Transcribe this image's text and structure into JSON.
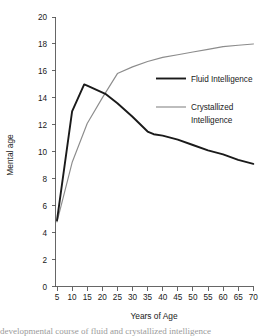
{
  "chart_data": {
    "type": "line",
    "title": "",
    "xlabel": "Years of Age",
    "ylabel": "Mental age",
    "xlim": [
      5,
      70
    ],
    "ylim": [
      0,
      20
    ],
    "grid": false,
    "legend_position": "inside-right",
    "xticks": [
      5,
      10,
      15,
      20,
      25,
      30,
      35,
      40,
      45,
      50,
      55,
      60,
      65,
      70
    ],
    "yticks": [
      0,
      2,
      4,
      6,
      8,
      10,
      12,
      14,
      16,
      18,
      20
    ],
    "series": [
      {
        "name": "Fluid Intelligence",
        "color": "#1a1a1a",
        "x": [
          5,
          10,
          14,
          15,
          21,
          25,
          30,
          35,
          37,
          40,
          45,
          50,
          55,
          60,
          65,
          70
        ],
        "values": [
          4.9,
          13.0,
          15.0,
          14.9,
          14.3,
          13.6,
          12.6,
          11.5,
          11.3,
          11.2,
          10.9,
          10.5,
          10.1,
          9.8,
          9.4,
          9.1
        ]
      },
      {
        "name": "Crystallized Intelligence",
        "color": "#8c8c8c",
        "x": [
          5,
          10,
          15,
          20,
          25,
          30,
          35,
          40,
          45,
          50,
          55,
          60,
          65,
          70
        ],
        "values": [
          4.8,
          9.2,
          12.1,
          14.0,
          15.8,
          16.3,
          16.7,
          17.0,
          17.2,
          17.4,
          17.6,
          17.8,
          17.9,
          18.0
        ]
      }
    ]
  },
  "legend": {
    "entries": [
      {
        "label": "Fluid Intelligence",
        "color": "#1a1a1a"
      },
      {
        "label": "Crystallized",
        "label2": "Intelligence",
        "color": "#8c8c8c"
      }
    ],
    "fluid_label": "Fluid Intelligence",
    "crystal_label_line1": "Crystallized",
    "crystal_label_line2": "Intelligence"
  },
  "axes": {
    "y_title": "Mental age",
    "x_title": "Years of Age",
    "y_tick_labels": [
      "20",
      "18",
      "16",
      "14",
      "12",
      "10",
      "8",
      "6",
      "4",
      "2",
      "0"
    ],
    "x_tick_labels": [
      "5",
      "10",
      "15",
      "20",
      "25",
      "30",
      "35",
      "40",
      "45",
      "50",
      "55",
      "60",
      "65",
      "70"
    ]
  },
  "caption": {
    "text": "developmental course of fluid and crystallized intelligence"
  },
  "colors": {
    "fluid": "#1a1a1a",
    "crystallized": "#8c8c8c",
    "axis": "#555555",
    "background": "#ffffff"
  }
}
